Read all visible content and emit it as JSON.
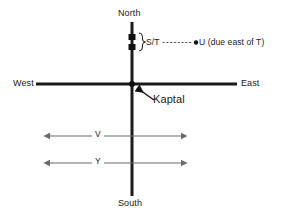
{
  "diagram": {
    "background_color": "#ffffff",
    "axis_color": "#1a1a1a",
    "arrow_color": "#6b6b6b",
    "marker_color": "#111111",
    "compass": {
      "north_label": "North",
      "south_label": "South",
      "west_label": "West",
      "east_label": "East"
    },
    "origin": {
      "label": "Kaptal",
      "marker": "origin-dot",
      "pointer": "arrow-pointing-to-origin"
    },
    "markers": {
      "st_label": "S/T",
      "st_brace": "}",
      "st_marker_count": 2,
      "u_label": "U (due east of T)",
      "u_marker": "dot",
      "connector_style": "dotted"
    },
    "spans": [
      {
        "label": "V",
        "style": "double-headed-arrow"
      },
      {
        "label": "Y",
        "style": "double-headed-arrow"
      }
    ]
  }
}
